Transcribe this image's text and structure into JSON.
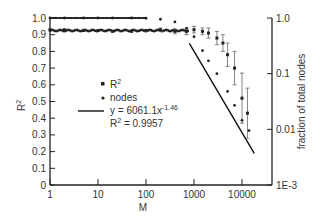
{
  "chart_data": {
    "type": "scatter",
    "title": "",
    "xlabel": "M",
    "ylabel": "R2",
    "ylabel_right": "fraction of total nodes",
    "x_scale": "log",
    "xlim": [
      1,
      30000
    ],
    "ylim": [
      0,
      1.0
    ],
    "ylim_right": [
      0.001,
      1.0
    ],
    "x_ticks": [
      "1",
      "10",
      "100",
      "1000",
      "10000"
    ],
    "y_ticks": [
      "0",
      "0.1",
      "0.2",
      "0.3",
      "0.4",
      "0.5",
      "0.6",
      "0.7",
      "0.8",
      "0.9",
      "1.0"
    ],
    "y_right_ticks": [
      "1E-3",
      "0.01",
      "0.1",
      "1.0"
    ],
    "grid": false,
    "legend_position": "center-left",
    "legend": [
      {
        "symbol": "square",
        "label": "R",
        "sup": "2"
      },
      {
        "symbol": "dot",
        "label": "nodes",
        "sup": ""
      },
      {
        "symbol": "line",
        "label": "y = 6061.1x",
        "sup": "-1.46"
      },
      {
        "symbol": "none",
        "label": "R",
        "sup": "2",
        "suffix": " = 0.9957"
      }
    ],
    "series": [
      {
        "name": "R2",
        "axis": "left",
        "marker": "square",
        "x": [
          1,
          2,
          5,
          10,
          20,
          50,
          100,
          200,
          400,
          700,
          1000,
          1500,
          2000,
          3000,
          4000,
          5000,
          7000,
          10000,
          13000
        ],
        "y": [
          0.93,
          0.93,
          0.925,
          0.925,
          0.92,
          0.92,
          0.925,
          0.93,
          0.92,
          0.92,
          0.93,
          0.92,
          0.91,
          0.88,
          0.85,
          0.78,
          0.7,
          0.52,
          0.43
        ],
        "err": [
          0.0,
          0.0,
          0.0,
          0.0,
          0.0,
          0.0,
          0.005,
          0.01,
          0.015,
          0.02,
          0.02,
          0.02,
          0.03,
          0.04,
          0.05,
          0.07,
          0.1,
          0.15,
          0.15
        ]
      },
      {
        "name": "nodes",
        "axis": "right",
        "marker": "dot",
        "x": [
          1,
          2,
          5,
          10,
          20,
          50,
          100,
          200,
          400,
          700,
          1000,
          1500,
          2000,
          3000,
          5000,
          7000,
          10000,
          14000
        ],
        "y": [
          1.0,
          1.0,
          1.0,
          1.0,
          1.0,
          1.0,
          0.99,
          0.95,
          0.85,
          0.65,
          0.46,
          0.26,
          0.17,
          0.1,
          0.048,
          0.027,
          0.0145,
          0.0095
        ]
      },
      {
        "name": "fit",
        "axis": "right",
        "type": "line",
        "equation": "y = 6061.1x^-1.46",
        "r2": 0.9957,
        "x_range": [
          800,
          18000
        ]
      }
    ]
  }
}
